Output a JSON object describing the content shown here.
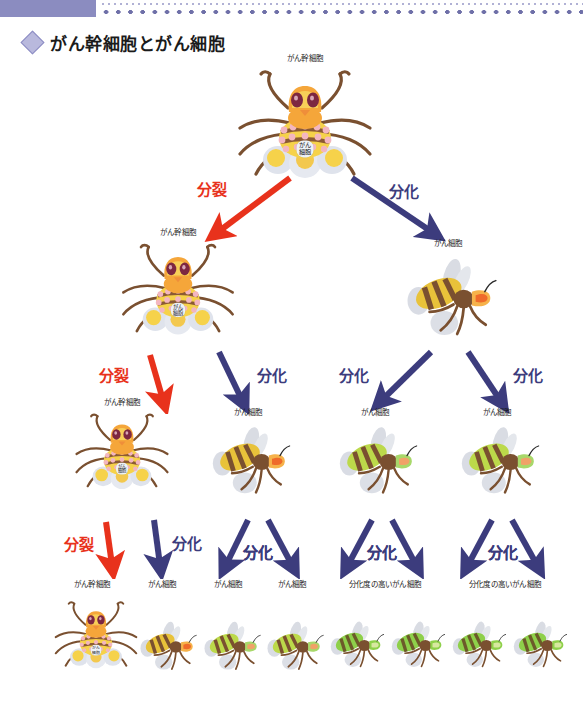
{
  "page": {
    "language": "ja",
    "background": "#ffffff",
    "width": 583,
    "height": 713
  },
  "header": {
    "bar_color": "#8b8cc0",
    "dot_color": "#6f70a8",
    "bullet_icon": "diamond-icon"
  },
  "title": {
    "text": "がん幹細胞とがん細胞",
    "bullet": "◇"
  },
  "colors": {
    "division_red": "#e8321c",
    "differentiation_navy": "#3c3c7d",
    "stem_body_orange": "#f5a63a",
    "stem_body_yellow": "#f6d24a",
    "cancer_yellow": "#e8c23a",
    "cancer_green": "#8ed04a",
    "limb_brown": "#7a5030",
    "egg_gray": "#c9ccd6"
  },
  "arrow_labels": {
    "division": "分裂",
    "differentiation": "分化"
  },
  "cell_labels": {
    "stem": "がん幹細胞",
    "cancer": "がん細胞",
    "cancer_badge_line1": "がん",
    "cancer_badge_line2": "細胞",
    "high_diff": "分化度の高いがん細胞"
  },
  "rows": [
    {
      "id": "row-1",
      "nodes": [
        {
          "name": "cancer-stem-cell",
          "type": "stem",
          "caption": "がん幹細胞",
          "x": 305,
          "y": 68,
          "scale": 1.0,
          "badge": true
        }
      ],
      "arrows": [
        {
          "name": "division-arrow",
          "label": "分裂",
          "color": "#e8321c",
          "from_x": 290,
          "from_y": 178,
          "to_x": 218,
          "to_y": 232,
          "label_x": 212,
          "label_y": 178
        },
        {
          "name": "differentiation-arrow",
          "label": "分化",
          "color": "#3c3c7d",
          "from_x": 352,
          "from_y": 178,
          "to_x": 432,
          "to_y": 232,
          "label_x": 404,
          "label_y": 180
        }
      ]
    },
    {
      "id": "row-2",
      "nodes": [
        {
          "name": "cancer-stem-cell",
          "type": "stem",
          "caption": "がん幹細胞",
          "x": 178,
          "y": 242,
          "scale": 0.84,
          "badge": true
        },
        {
          "name": "cancer-cell",
          "type": "bee",
          "variant": "yellow",
          "caption": "がん細胞",
          "x": 448,
          "y": 253,
          "scale": 0.92
        }
      ],
      "arrows": [
        {
          "name": "division-arrow",
          "label": "分裂",
          "color": "#e8321c",
          "from_x": 150,
          "from_y": 355,
          "to_x": 163,
          "to_y": 400,
          "label_x": 114,
          "label_y": 364
        },
        {
          "name": "differentiation-arrow",
          "label": "分化",
          "color": "#3c3c7d",
          "from_x": 219,
          "from_y": 352,
          "to_x": 242,
          "to_y": 400,
          "label_x": 272,
          "label_y": 364
        },
        {
          "name": "differentiation-arrow",
          "label": "分化",
          "color": "#3c3c7d",
          "from_x": 431,
          "from_y": 352,
          "to_x": 382,
          "to_y": 400,
          "label_x": 354,
          "label_y": 364
        },
        {
          "name": "differentiation-arrow",
          "label": "分化",
          "color": "#3c3c7d",
          "from_x": 468,
          "from_y": 352,
          "to_x": 500,
          "to_y": 400,
          "label_x": 528,
          "label_y": 364
        }
      ]
    },
    {
      "id": "row-3",
      "nodes": [
        {
          "name": "cancer-stem-cell",
          "type": "stem",
          "caption": "がん幹細胞",
          "x": 122,
          "y": 412,
          "scale": 0.7,
          "badge": true
        },
        {
          "name": "cancer-cell",
          "type": "bee",
          "variant": "yellow",
          "caption": "がん細胞",
          "x": 248,
          "y": 422,
          "scale": 0.8
        },
        {
          "name": "cancer-cell",
          "type": "bee",
          "variant": "green-yellow",
          "caption": "がん細胞",
          "x": 375,
          "y": 422,
          "scale": 0.8
        },
        {
          "name": "cancer-cell",
          "type": "bee",
          "variant": "green-yellow",
          "caption": "がん細胞",
          "x": 497,
          "y": 422,
          "scale": 0.8
        }
      ],
      "arrows": [
        {
          "name": "division-arrow",
          "label": "分裂",
          "color": "#e8321c",
          "from_x": 106,
          "from_y": 522,
          "to_x": 112,
          "to_y": 565,
          "label_x": 79,
          "label_y": 533
        },
        {
          "name": "differentiation-arrow",
          "label": "分化",
          "color": "#3c3c7d",
          "from_x": 154,
          "from_y": 520,
          "to_x": 160,
          "to_y": 565,
          "label_x": 187,
          "label_y": 532
        },
        {
          "name": "differentiation-arrow",
          "label": "分化",
          "color": "#3c3c7d",
          "from_x": 248,
          "from_y": 520,
          "to_x": 226,
          "to_y": 565,
          "label_x": 258,
          "label_y": 541
        },
        {
          "name": "differentiation-arrow",
          "label": "分化",
          "color": "#3c3c7d",
          "from_x": 268,
          "from_y": 520,
          "to_x": 292,
          "to_y": 565,
          "label_x": 258,
          "label_y": 541
        },
        {
          "name": "differentiation-arrow",
          "label": "分化",
          "color": "#3c3c7d",
          "from_x": 372,
          "from_y": 520,
          "to_x": 348,
          "to_y": 565,
          "label_x": 382,
          "label_y": 541
        },
        {
          "name": "differentiation-arrow",
          "label": "分化",
          "color": "#3c3c7d",
          "from_x": 392,
          "from_y": 520,
          "to_x": 416,
          "to_y": 565,
          "label_x": 382,
          "label_y": 541
        },
        {
          "name": "differentiation-arrow",
          "label": "分化",
          "color": "#3c3c7d",
          "from_x": 492,
          "from_y": 520,
          "to_x": 468,
          "to_y": 565,
          "label_x": 503,
          "label_y": 541
        },
        {
          "name": "differentiation-arrow",
          "label": "分化",
          "color": "#3c3c7d",
          "from_x": 512,
          "from_y": 520,
          "to_x": 537,
          "to_y": 565,
          "label_x": 503,
          "label_y": 541
        }
      ]
    },
    {
      "id": "row-4",
      "captions": [
        {
          "text": "がん幹細胞",
          "x": 92,
          "y": 578
        },
        {
          "text": "がん細胞",
          "x": 162,
          "y": 578
        },
        {
          "text": "がん細胞",
          "x": 228,
          "y": 578
        },
        {
          "text": "がん細胞",
          "x": 292,
          "y": 578
        },
        {
          "text": "分化度の高いがん細胞",
          "x": 385,
          "y": 578
        },
        {
          "text": "分化度の高いがん細胞",
          "x": 505,
          "y": 578
        }
      ],
      "nodes": [
        {
          "name": "cancer-stem-cell",
          "type": "stem",
          "variant": "stem",
          "x": 96,
          "y": 600,
          "scale": 0.62,
          "badge": true
        },
        {
          "name": "cancer-cell",
          "type": "bee",
          "variant": "yellow",
          "x": 166,
          "y": 618,
          "scale": 0.58
        },
        {
          "name": "cancer-cell",
          "type": "bee",
          "variant": "green-yellow",
          "x": 230,
          "y": 618,
          "scale": 0.58
        },
        {
          "name": "cancer-cell",
          "type": "bee",
          "variant": "green-yellow",
          "x": 293,
          "y": 618,
          "scale": 0.58
        },
        {
          "name": "high-differentiated-cancer-cell",
          "type": "bee",
          "variant": "green",
          "x": 355,
          "y": 618,
          "scale": 0.55
        },
        {
          "name": "high-differentiated-cancer-cell",
          "type": "bee",
          "variant": "green",
          "x": 416,
          "y": 618,
          "scale": 0.55
        },
        {
          "name": "high-differentiated-cancer-cell",
          "type": "bee",
          "variant": "green",
          "x": 477,
          "y": 618,
          "scale": 0.55
        },
        {
          "name": "high-differentiated-cancer-cell",
          "type": "bee",
          "variant": "green",
          "x": 538,
          "y": 618,
          "scale": 0.55
        }
      ]
    }
  ]
}
